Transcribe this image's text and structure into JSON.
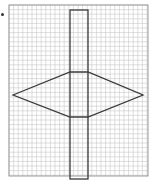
{
  "figure": {
    "type": "grid-drawing",
    "colors": {
      "background": "#ffffff",
      "grid_line": "#c8c8c8",
      "grid_border": "#9a9a9a",
      "shape_stroke": "#3a3a3a",
      "bullet": "#333333"
    },
    "grid": {
      "x": 9,
      "y": 5,
      "width": 139,
      "height": 171,
      "cell": 4.6
    },
    "rectangle": {
      "x": 70,
      "y": 10,
      "width": 18,
      "height": 169
    },
    "hexagon": {
      "points": [
        [
          13,
          95
        ],
        [
          70,
          72
        ],
        [
          88,
          72
        ],
        [
          143,
          95
        ],
        [
          88,
          117
        ],
        [
          70,
          117
        ]
      ]
    }
  }
}
